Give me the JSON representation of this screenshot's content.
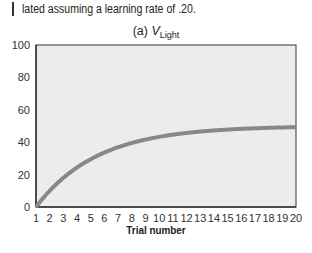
{
  "caption": "lated assuming a learning rate of .20.",
  "chart_data": {
    "type": "line",
    "title_prefix": "(a) ",
    "title_var": "V",
    "title_sub": "Light",
    "xlabel": "Trial number",
    "ylabel": "",
    "x": [
      1,
      2,
      3,
      4,
      5,
      6,
      7,
      8,
      9,
      10,
      11,
      12,
      13,
      14,
      15,
      16,
      17,
      18,
      19,
      20
    ],
    "series": [
      {
        "name": "V_Light",
        "values": [
          0,
          10,
          18,
          24.4,
          29.5,
          33.6,
          36.9,
          39.5,
          41.6,
          43.3,
          44.6,
          45.7,
          46.6,
          47.3,
          47.8,
          48.2,
          48.6,
          48.9,
          49.1,
          49.3
        ]
      }
    ],
    "xticks": [
      "1",
      "2",
      "3",
      "4",
      "5",
      "6",
      "7",
      "8",
      "9",
      "10",
      "11",
      "12",
      "13",
      "14",
      "15",
      "16",
      "17",
      "18",
      "19",
      "20"
    ],
    "yticks": [
      "0",
      "20",
      "40",
      "60",
      "80",
      "100"
    ],
    "xlim": [
      1,
      20
    ],
    "ylim": [
      0,
      100
    ],
    "grid": false,
    "legend": null,
    "colors": {
      "line": "#888888",
      "plot_bg": "#ececec",
      "axis": "#333333"
    }
  }
}
